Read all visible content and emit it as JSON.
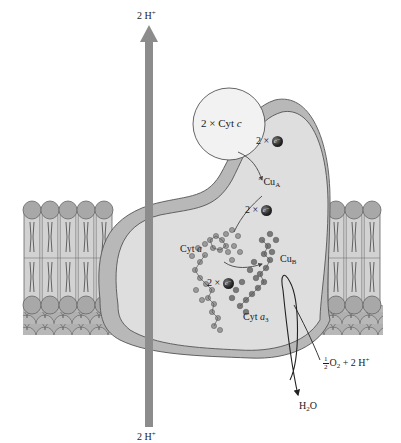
{
  "diagram": {
    "colors": {
      "protein_fill": "#dedede",
      "protein_shadow": "#b8b8b8",
      "protein_outline": "#555555",
      "cytc_fill": "#f2f2f2",
      "lipid_head": "#a8a8a8",
      "lipid_tail_fill": "#d0d0d0",
      "proton_arrow": "#8c8c8c",
      "electron": "#222222",
      "text": "#1a1a1a"
    },
    "labels": {
      "proton_top": {
        "num": "2 H",
        "sup": "+"
      },
      "proton_bottom": {
        "num": "2 H",
        "sup": "+"
      },
      "cyt_c": {
        "prefix": "2 × Cyt ",
        "italic": "c"
      },
      "electron_1": {
        "prefix": "2 × ",
        "symbol": "e⁻"
      },
      "electron_2": {
        "prefix": "2 × ",
        "symbol": "e⁻"
      },
      "electron_3": {
        "prefix": "2 × ",
        "symbol": "e⁻"
      },
      "cu_a": {
        "base": "Cu",
        "sub": "A"
      },
      "cu_b": {
        "base": "Cu",
        "sub": "B"
      },
      "cyt_a": {
        "prefix": "Cyt ",
        "italic": "a"
      },
      "cyt_a3": {
        "prefix": "Cyt ",
        "italic": "a",
        "sub": "3"
      },
      "oxygen": {
        "num": "1",
        "den": "2",
        "rest": "O",
        "sub": "2",
        "tail": " + 2 H",
        "sup": "+"
      },
      "water": {
        "base": "H",
        "sub": "2",
        "tail": "O"
      }
    }
  }
}
